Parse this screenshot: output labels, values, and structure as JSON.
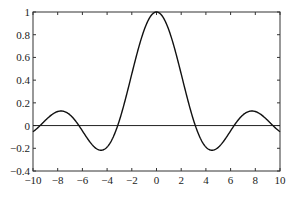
{
  "chart_data": {
    "type": "line",
    "title": "",
    "xlabel": "",
    "ylabel": "",
    "xlim": [
      -10,
      10
    ],
    "ylim": [
      -0.4,
      1
    ],
    "grid": false,
    "xticks": [
      -10,
      -8,
      -6,
      -4,
      -2,
      0,
      2,
      4,
      6,
      8,
      10
    ],
    "yticks": [
      -0.4,
      -0.2,
      0,
      0.2,
      0.4,
      0.6,
      0.8,
      1
    ],
    "ytick_labels": [
      "-0.4",
      "-0.2",
      "0",
      "0.2",
      "0.4",
      "0.6",
      "0.8",
      "1"
    ],
    "xtick_labels": [
      "-10",
      "-8",
      "-6",
      "-4",
      "-2",
      "0",
      "2",
      "4",
      "6",
      "8",
      "10"
    ],
    "series": [
      {
        "name": "sin(x)/x",
        "function": "sinc",
        "x": [
          -10,
          -8,
          -6,
          -4,
          -2,
          0,
          2,
          4,
          6,
          8,
          10
        ],
        "values": [
          -0.054,
          0.124,
          -0.047,
          -0.189,
          0.455,
          1,
          0.455,
          -0.189,
          -0.047,
          0.124,
          -0.054
        ],
        "color": "#111111"
      },
      {
        "name": "zero line",
        "values": [
          0,
          0
        ],
        "x": [
          -10,
          10
        ],
        "color": "#111111"
      }
    ]
  }
}
